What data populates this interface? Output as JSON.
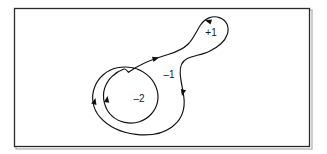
{
  "figure": {
    "background_color": "#ffffff",
    "frame": {
      "stroke_color": "#2b2b2b",
      "fill_color": "#ffffff",
      "x": 14,
      "y": 8,
      "width": 296,
      "height": 139
    },
    "curve": {
      "stroke_color": "#111111",
      "stroke_width": 1.1,
      "description": "closed spiral curve crossing itself twice, forming an inner disc, an annular region and a small upper-right loop"
    },
    "labels": [
      {
        "id": "label-plus-one",
        "text": "+1",
        "x": 211,
        "y": 33,
        "region": "upper-right loop"
      },
      {
        "id": "label-minus-one",
        "text": "–1",
        "x": 169,
        "y": 75,
        "region": "annular region between outer loop and inner circle"
      },
      {
        "id": "label-minus-two",
        "text": "–2",
        "x": 139,
        "y": 99,
        "region": "inner disc"
      }
    ],
    "arrowheads": [
      {
        "id": "arrow-upper-curve-right",
        "x": 158,
        "y": 58,
        "angle": -18,
        "direction": "right"
      },
      {
        "id": "arrow-top-loop-left",
        "x": 205,
        "y": 20,
        "angle": 200,
        "direction": "left"
      },
      {
        "id": "arrow-right-descending-down",
        "x": 181.5,
        "y": 95,
        "angle": 104,
        "direction": "down"
      },
      {
        "id": "arrow-inner-circle-up",
        "x": 113.5,
        "y": 98,
        "angle": -86,
        "direction": "up"
      },
      {
        "id": "arrow-outer-loop-up",
        "x": 97,
        "y": 99,
        "angle": -80,
        "direction": "up"
      }
    ]
  }
}
